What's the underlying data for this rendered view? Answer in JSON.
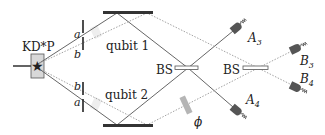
{
  "diagram": {
    "source": {
      "label": "KD*P",
      "icon": "star-icon"
    },
    "slits": {
      "upper": {
        "a_label": "a",
        "b_label": "b"
      },
      "lower": {
        "a_label": "a",
        "b_label": "b"
      }
    },
    "qubits": {
      "upper": "qubit 1",
      "lower": "qubit 2"
    },
    "beam_splitters": {
      "first": "BS",
      "second": "BS"
    },
    "phase_shifter": {
      "label": "ϕ"
    },
    "detectors": {
      "A3": {
        "name": "A",
        "sub": "3"
      },
      "A4": {
        "name": "A",
        "sub": "4"
      },
      "B3": {
        "name": "B",
        "sub": "3"
      },
      "B4": {
        "name": "B",
        "sub": "4"
      }
    },
    "colors": {
      "line": "#555555",
      "mirror": "#333333",
      "detector": "#555555",
      "crystal_fill": "#d0d0d0",
      "phase_plate": "#b0b0b0",
      "dotted": "#999999"
    }
  }
}
